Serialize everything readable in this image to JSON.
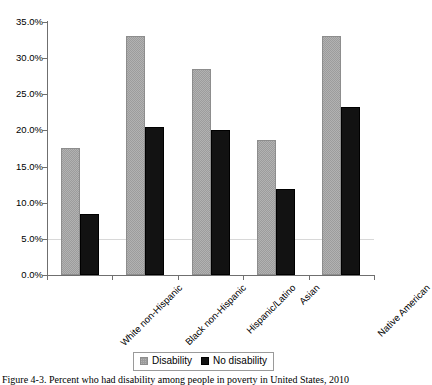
{
  "chart_data": {
    "type": "bar",
    "title": "",
    "xlabel": "",
    "ylabel": "",
    "ylim": [
      0,
      35
    ],
    "ytick_labels": [
      "0.0%",
      "5.0%",
      "10.0%",
      "15.0%",
      "20.0%",
      "25.0%",
      "30.0%",
      "35.0%"
    ],
    "ytick_values": [
      0,
      5,
      10,
      15,
      20,
      25,
      30,
      35
    ],
    "grid": false,
    "legend_position": "bottom-center",
    "categories": [
      "White non-Hispanic",
      "Black non-Hispanic",
      "Hispanic/Latino",
      "Asian",
      "Native American"
    ],
    "series": [
      {
        "name": "Disability",
        "color": "#9c9c9c",
        "values": [
          17.6,
          33.0,
          28.5,
          18.7,
          33.0
        ]
      },
      {
        "name": "No disability",
        "color": "#121212",
        "values": [
          8.5,
          20.5,
          20.0,
          11.9,
          23.3
        ]
      }
    ]
  },
  "legend": {
    "items": [
      {
        "label": "Disability",
        "swatch": "gray"
      },
      {
        "label": "No disability",
        "swatch": "black"
      }
    ]
  },
  "caption": {
    "text": "Figure 4-3. Percent who had disability among people in poverty in United States, 2010"
  }
}
